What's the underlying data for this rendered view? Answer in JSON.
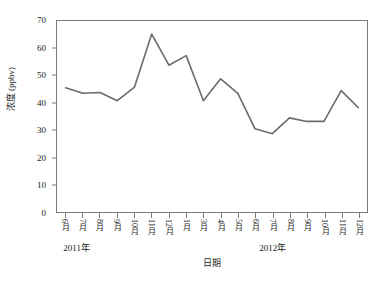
{
  "chart_data": {
    "type": "line",
    "title": "",
    "subtitle": "",
    "xlabel": "日期",
    "ylabel": "浓度 (ppbv)",
    "ylim": [
      0,
      70
    ],
    "yticks": [
      0,
      10,
      20,
      30,
      40,
      50,
      60,
      70
    ],
    "ytick_labels": [
      "0",
      "10",
      "20",
      "30",
      "40",
      "50",
      "60",
      "70"
    ],
    "grid": false,
    "legend": false,
    "legend_position": "none",
    "categories": [
      "6月",
      "7月",
      "8月",
      "9月",
      "10月",
      "11月",
      "12月",
      "1月",
      "3月",
      "4月",
      "5月",
      "6月",
      "7月",
      "8月",
      "9月",
      "10月",
      "11月",
      "12月"
    ],
    "values": [
      45.5,
      43.5,
      43.8,
      40.8,
      45.8,
      65.2,
      53.8,
      57.3,
      40.8,
      48.8,
      43.5,
      30.5,
      28.7,
      34.5,
      33.2,
      33.2,
      44.5,
      38.2
    ],
    "series": [
      {
        "name": "浓度",
        "color": "#6b6b6b",
        "values": [
          45.5,
          43.5,
          43.8,
          40.8,
          45.8,
          65.2,
          53.8,
          57.3,
          40.8,
          48.8,
          43.5,
          30.5,
          28.7,
          34.5,
          33.2,
          33.2,
          44.5,
          38.2
        ]
      }
    ],
    "group_labels": [
      {
        "text": "2011年",
        "start_index": 0,
        "end_index": 6
      },
      {
        "text": "2012年",
        "start_index": 7,
        "end_index": 17
      }
    ],
    "annotations": []
  },
  "style": {
    "line_color": "#6b6b6b",
    "axis_color": "#7a7a7a",
    "text_color": "#1a1a1a",
    "background": "#ffffff"
  }
}
